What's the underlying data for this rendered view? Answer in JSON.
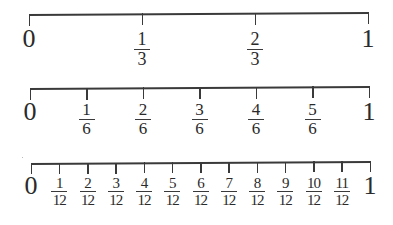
{
  "diagram": {
    "title": "",
    "number_lines": [
      {
        "name": "thirds",
        "start_label": "0",
        "end_label": "1",
        "fractions": [
          {
            "numerator": "1",
            "denominator": "3"
          },
          {
            "numerator": "2",
            "denominator": "3"
          }
        ]
      },
      {
        "name": "sixths",
        "start_label": "0",
        "end_label": "1",
        "fractions": [
          {
            "numerator": "1",
            "denominator": "6"
          },
          {
            "numerator": "2",
            "denominator": "6"
          },
          {
            "numerator": "3",
            "denominator": "6"
          },
          {
            "numerator": "4",
            "denominator": "6"
          },
          {
            "numerator": "5",
            "denominator": "6"
          }
        ]
      },
      {
        "name": "twelfths",
        "start_label": "0",
        "end_label": "1",
        "fractions": [
          {
            "numerator": "1",
            "denominator": "12"
          },
          {
            "numerator": "2",
            "denominator": "12"
          },
          {
            "numerator": "3",
            "denominator": "12"
          },
          {
            "numerator": "4",
            "denominator": "12"
          },
          {
            "numerator": "5",
            "denominator": "12"
          },
          {
            "numerator": "6",
            "denominator": "12"
          },
          {
            "numerator": "7",
            "denominator": "12"
          },
          {
            "numerator": "8",
            "denominator": "12"
          },
          {
            "numerator": "9",
            "denominator": "12"
          },
          {
            "numerator": "10",
            "denominator": "12"
          },
          {
            "numerator": "11",
            "denominator": "12"
          }
        ]
      }
    ],
    "colors": {
      "line": "#3a3a3a",
      "text": "#2a2a2a",
      "background": "#ffffff"
    }
  }
}
